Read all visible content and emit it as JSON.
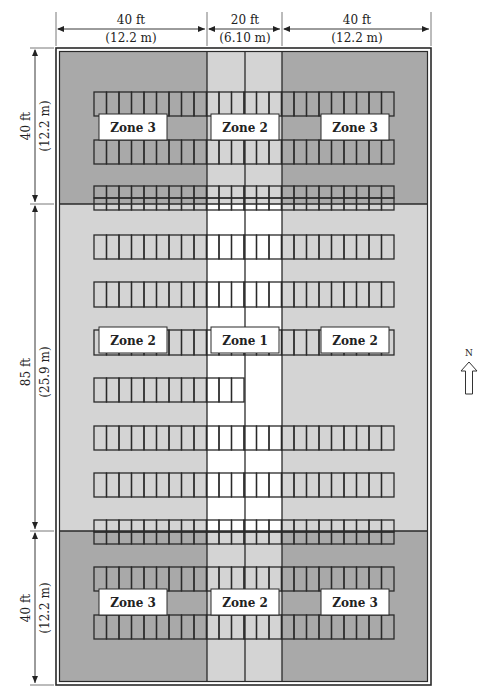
{
  "diagram": {
    "type": "parking-lot-zone-plan",
    "colors": {
      "zone1": "#ffffff",
      "zone2": "#d4d4d4",
      "zone3": "#a9a9a9",
      "line": "#2a2a2a",
      "label_bg": "#ffffff"
    },
    "dimensions": {
      "top": [
        {
          "ft": "40 ft",
          "m": "(12.2 m)"
        },
        {
          "ft": "20 ft",
          "m": "(6.10 m)"
        },
        {
          "ft": "40 ft",
          "m": "(12.2 m)"
        }
      ],
      "left": [
        {
          "ft": "40 ft",
          "m": "(12.2 m)"
        },
        {
          "ft": "85 ft",
          "m": "(25.9 m)"
        },
        {
          "ft": "40 ft",
          "m": "(12.2 m)"
        }
      ]
    },
    "zone_grid": [
      [
        "Zone 3",
        "Zone 2",
        "Zone 3"
      ],
      [
        "Zone 2",
        "Zone 1",
        "Zone 2"
      ],
      [
        "Zone 3",
        "Zone 2",
        "Zone 3"
      ]
    ],
    "zone_labels": [
      {
        "text": "Zone 3",
        "band": "north",
        "column": "west"
      },
      {
        "text": "Zone 2",
        "band": "north",
        "column": "center"
      },
      {
        "text": "Zone 3",
        "band": "north",
        "column": "east"
      },
      {
        "text": "Zone 2",
        "band": "middle",
        "column": "west"
      },
      {
        "text": "Zone 1",
        "band": "middle",
        "column": "center"
      },
      {
        "text": "Zone 2",
        "band": "middle",
        "column": "east"
      },
      {
        "text": "Zone 3",
        "band": "south",
        "column": "west"
      },
      {
        "text": "Zone 2",
        "band": "south",
        "column": "center"
      },
      {
        "text": "Zone 3",
        "band": "south",
        "column": "east"
      }
    ],
    "stall_rows": {
      "stalls_per_row": 24,
      "rows_count": 13
    },
    "north_arrow": {
      "label": "N"
    }
  }
}
